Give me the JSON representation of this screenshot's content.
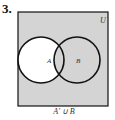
{
  "problem_number": "3.",
  "universe_label": "U",
  "set_a_label": "A",
  "set_b_label": "B",
  "caption": "A' ∪ B",
  "colors": {
    "shade": "#d4d4d4",
    "stroke": "#111111",
    "unshaded": "#ffffff"
  }
}
